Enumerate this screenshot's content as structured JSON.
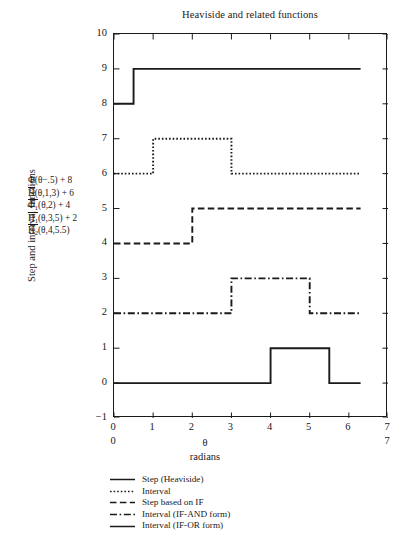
{
  "chart_data": {
    "type": "line",
    "title": "Heaviside and related functions",
    "xlabel": "θ",
    "xlabel_units": "radians",
    "ylabel": "Step and interval functions",
    "xlim": [
      0,
      7
    ],
    "ylim": [
      -1,
      10
    ],
    "xticks": [
      "0",
      "1",
      "2",
      "3",
      "4",
      "5",
      "6",
      "7"
    ],
    "xticks_secondary": [
      "0",
      "7"
    ],
    "yticks": [
      "-1",
      "0",
      "1",
      "2",
      "3",
      "4",
      "5",
      "6",
      "7",
      "8",
      "9",
      "10"
    ],
    "grid": false,
    "legend_position": "below-plot",
    "series": [
      {
        "name": "Step (Heaviside)",
        "formula": "Φ(θ−.5) + 8",
        "style": "solid",
        "x": [
          0,
          0.5,
          0.5,
          6.3
        ],
        "y": [
          8,
          8,
          9,
          9
        ],
        "baseline": 8,
        "high": 9,
        "steps": [
          {
            "at": 0.5,
            "to": 9
          }
        ]
      },
      {
        "name": "Interval",
        "formula": "H̄(θ,1,3) + 6",
        "style": "dotted",
        "x": [
          0,
          1,
          1,
          3,
          3,
          6.3
        ],
        "y": [
          6,
          6,
          7,
          7,
          6,
          6
        ],
        "baseline": 6,
        "high": 7,
        "steps": [
          {
            "at": 1,
            "to": 7
          },
          {
            "at": 3,
            "to": 6
          }
        ]
      },
      {
        "name": "Step based on IF",
        "formula": "Φ̄1(θ,2) + 4",
        "style": "dashed",
        "x": [
          0,
          2,
          2,
          6.3
        ],
        "y": [
          4,
          4,
          5,
          5
        ],
        "baseline": 4,
        "high": 5,
        "steps": [
          {
            "at": 2,
            "to": 5
          }
        ]
      },
      {
        "name": "Interval (IF-AND form)",
        "formula": "H̄1(θ,3,5) + 2",
        "style": "dashdot",
        "x": [
          0,
          3,
          3,
          5,
          5,
          6.3
        ],
        "y": [
          2,
          2,
          3,
          3,
          2,
          2
        ],
        "baseline": 2,
        "high": 3,
        "steps": [
          {
            "at": 3,
            "to": 3
          },
          {
            "at": 5,
            "to": 2
          }
        ]
      },
      {
        "name": "Interval (IF-OR form)",
        "formula": "H̄2(θ,4,5.5)",
        "style": "solid",
        "x": [
          0,
          4,
          4,
          5.5,
          5.5,
          6.3
        ],
        "y": [
          0,
          0,
          1,
          1,
          0,
          0
        ],
        "baseline": 0,
        "high": 1,
        "steps": [
          {
            "at": 4,
            "to": 1
          },
          {
            "at": 5.5,
            "to": 0
          }
        ]
      }
    ],
    "formula_legend": [
      {
        "lead": "Φ(θ−.5) + 8",
        "overline": false
      },
      {
        "lead": "H(θ,1,3) + 6",
        "overline": true
      },
      {
        "lead": "Φ",
        "sub": "1",
        "rest": "(θ,2) + 4",
        "overline": true
      },
      {
        "lead": "H",
        "sub": "1",
        "rest": "(θ,3,5) + 2",
        "overline": true
      },
      {
        "lead": "H",
        "sub": "2",
        "rest": "(θ,4,5.5)",
        "overline": true
      }
    ],
    "legend_entries": [
      {
        "label": "Step (Heaviside)",
        "style": "solid"
      },
      {
        "label": "Interval",
        "style": "dotted"
      },
      {
        "label": "Step based on IF",
        "style": "dashed"
      },
      {
        "label": "Interval (IF-AND form)",
        "style": "dashdot"
      },
      {
        "label": "Interval (IF-OR form)",
        "style": "solid"
      }
    ],
    "line_color": "#1a1a1a"
  },
  "formulas": {
    "f1": "Φ(θ−.5) + 8",
    "f2_base": "H",
    "f2_rest": "(θ,1,3) + 6",
    "f3_base": "Φ",
    "f3_sub": "1",
    "f3_rest": "(θ,2) + 4",
    "f4_base": "H",
    "f4_sub": "1",
    "f4_rest": "(θ,3,5) + 2",
    "f5_base": "H",
    "f5_sub": "2",
    "f5_rest": "(θ,4,5.5)"
  }
}
